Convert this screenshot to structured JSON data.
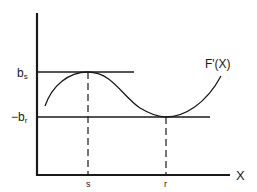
{
  "diagram": {
    "curve_label": "F'(X)",
    "x_axis_label": "X",
    "y_labels": {
      "upper": {
        "main": "b",
        "sub": "s"
      },
      "lower": {
        "prefix": "−",
        "main": "b",
        "sub": "r"
      }
    },
    "x_ticks": {
      "s": "s",
      "r": "r"
    },
    "colors": {
      "ink": "#1a1a1a",
      "background": "#ffffff"
    }
  }
}
